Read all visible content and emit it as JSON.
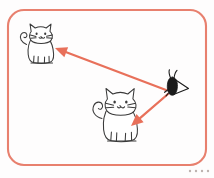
{
  "scene": {
    "title": "Two cats looking at a moth",
    "background_color": "#fefdfd",
    "frame": {
      "name": "rounded-panel-border",
      "color": "#e8806e",
      "stroke_width": 2.1,
      "corner_radius": 16,
      "x": 8,
      "y": 10,
      "width": 198,
      "height": 155
    },
    "figures": [
      {
        "id": "cat-top-left",
        "label": "cat-top-left",
        "style": "hand-drawn line art",
        "outline_color": "#3a3a3a",
        "fill_color": "#ffffff",
        "position": {
          "x": 20,
          "y": 22
        },
        "size": {
          "width": 38,
          "height": 50
        },
        "facing": "right"
      },
      {
        "id": "cat-bottom-center",
        "label": "cat-bottom-center",
        "style": "hand-drawn line art",
        "outline_color": "#3a3a3a",
        "fill_color": "#ffffff",
        "position": {
          "x": 93,
          "y": 88
        },
        "size": {
          "width": 50,
          "height": 68
        },
        "facing": "right"
      },
      {
        "id": "moth-right",
        "label": "moth-right",
        "style": "solid black silhouette",
        "outline_color": "#1b1b1b",
        "fill_color": "#1b1b1b",
        "position": {
          "x": 164,
          "y": 70
        },
        "size": {
          "width": 28,
          "height": 28
        }
      }
    ],
    "arrows": [
      {
        "id": "arrow-moth-to-top-cat",
        "label": "arrow-moth-to-top-cat",
        "color": "#e8705a",
        "from": {
          "x": 166,
          "y": 90
        },
        "to": {
          "x": 55,
          "y": 48
        },
        "head_at": "to",
        "stroke_width": 2.3
      },
      {
        "id": "arrow-moth-to-bottom-cat",
        "label": "arrow-moth-to-bottom-cat",
        "color": "#e8705a",
        "from": {
          "x": 168,
          "y": 94
        },
        "to": {
          "x": 131,
          "y": 126
        },
        "head_at": "to",
        "stroke_width": 2.3
      }
    ],
    "corner_dots": {
      "name": "bottom-right-dots",
      "color": "#bdb3b0",
      "count": 4,
      "radius": 1.2,
      "spacing": 6,
      "start": {
        "x": 190,
        "y": 171
      }
    }
  }
}
